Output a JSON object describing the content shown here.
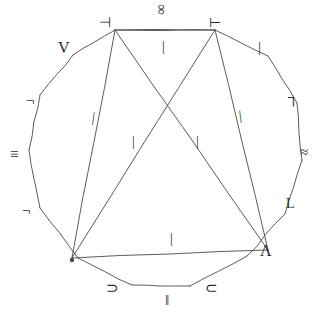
{
  "figure": {
    "stroke_color": "#4a4a4a",
    "symbol_color": "#2b2b2b",
    "background_color": "#ffffff",
    "width": 331,
    "height": 325
  },
  "chart_data": {
    "type": "diagram",
    "title": "",
    "xlabel": "",
    "ylabel": "",
    "polygon_vertices": [
      {
        "x": 115,
        "y": 30
      },
      {
        "x": 215,
        "y": 30
      },
      {
        "x": 268,
        "y": 56
      },
      {
        "x": 297,
        "y": 103
      },
      {
        "x": 302,
        "y": 160
      },
      {
        "x": 285,
        "y": 214
      },
      {
        "x": 247,
        "y": 256
      },
      {
        "x": 190,
        "y": 286
      },
      {
        "x": 132,
        "y": 285
      },
      {
        "x": 78,
        "y": 258
      },
      {
        "x": 40,
        "y": 208
      },
      {
        "x": 29,
        "y": 150
      },
      {
        "x": 40,
        "y": 95
      },
      {
        "x": 73,
        "y": 55
      }
    ],
    "triangle_vertices": [
      {
        "x": 115,
        "y": 30
      },
      {
        "x": 215,
        "y": 30
      },
      {
        "x": 72,
        "y": 258
      },
      {
        "x": 268,
        "y": 250
      }
    ],
    "chords": [
      {
        "from": {
          "x": 115,
          "y": 30
        },
        "to": {
          "x": 268,
          "y": 250
        }
      },
      {
        "from": {
          "x": 215,
          "y": 30
        },
        "to": {
          "x": 72,
          "y": 258
        }
      },
      {
        "from": {
          "x": 115,
          "y": 30
        },
        "to": {
          "x": 72,
          "y": 258
        }
      },
      {
        "from": {
          "x": 215,
          "y": 30
        },
        "to": {
          "x": 268,
          "y": 250
        }
      },
      {
        "from": {
          "x": 115,
          "y": 30
        },
        "to": {
          "x": 215,
          "y": 30
        }
      },
      {
        "from": {
          "x": 72,
          "y": 258
        },
        "to": {
          "x": 268,
          "y": 250
        }
      }
    ],
    "marked_point": {
      "x": 72,
      "y": 260,
      "label": "dot"
    }
  },
  "symbols": {
    "outer": [
      {
        "id": "infinity",
        "glyph": "∞",
        "name": "infinity-symbol",
        "x": 156,
        "y": 2,
        "size": 15,
        "rotate": 90
      },
      {
        "id": "turnstile_left",
        "glyph": "⊣",
        "name": "turnstile-left-symbol",
        "x": 99,
        "y": 16,
        "size": 14,
        "rotate": 0
      },
      {
        "id": "turnstile_right",
        "glyph": "⊢",
        "name": "turnstile-right-symbol",
        "x": 209,
        "y": 16,
        "size": 14,
        "rotate": 0
      },
      {
        "id": "vee_upper_left",
        "glyph": "V",
        "name": "vee-symbol",
        "x": 58,
        "y": 40,
        "size": 16,
        "rotate": 0
      },
      {
        "id": "tick_upper_right",
        "glyph": "|",
        "name": "tick-mark-upper-right",
        "x": 258,
        "y": 40,
        "size": 15,
        "rotate": 0
      },
      {
        "id": "corner_left_upper",
        "glyph": "¬",
        "name": "corner-upper-left-symbol",
        "x": 26,
        "y": 93,
        "size": 15,
        "rotate": 0
      },
      {
        "id": "corner_right_upper",
        "glyph": "┐",
        "name": "corner-upper-right-symbol",
        "x": 288,
        "y": 90,
        "size": 15,
        "rotate": 0
      },
      {
        "id": "identical_left",
        "glyph": "≡",
        "name": "identical-to-symbol",
        "x": 10,
        "y": 147,
        "size": 15,
        "rotate": 0
      },
      {
        "id": "approx_right",
        "glyph": "≈",
        "name": "approximately-equal-symbol",
        "x": 300,
        "y": 145,
        "size": 15,
        "rotate": 0
      },
      {
        "id": "corner_left_lower",
        "glyph": "¬",
        "name": "corner-lower-left-symbol",
        "x": 22,
        "y": 203,
        "size": 15,
        "rotate": 0
      },
      {
        "id": "ell_right_lower",
        "glyph": "L",
        "name": "ell-lower-right-symbol",
        "x": 286,
        "y": 197,
        "size": 14,
        "rotate": 0
      },
      {
        "id": "wedge_lower_right",
        "glyph": "Λ",
        "name": "wedge-symbol",
        "x": 260,
        "y": 243,
        "size": 16,
        "rotate": 0
      },
      {
        "id": "superset_bottom_left",
        "glyph": "⊃",
        "name": "superset-symbol",
        "x": 106,
        "y": 281,
        "size": 15,
        "rotate": 0
      },
      {
        "id": "parallel_bottom",
        "glyph": "‖",
        "name": "parallel-symbol",
        "x": 165,
        "y": 293,
        "size": 15,
        "rotate": 0
      },
      {
        "id": "subset_bottom_right",
        "glyph": "⊂",
        "name": "subset-symbol",
        "x": 205,
        "y": 281,
        "size": 15,
        "rotate": 0
      }
    ],
    "inner_ticks": [
      {
        "id": "tick_top_center",
        "glyph": "|",
        "name": "tick-mark-top-center",
        "x": 162,
        "y": 40,
        "size": 14,
        "rotate": 0
      },
      {
        "id": "tick_left_edge",
        "glyph": "|",
        "name": "tick-mark-left-edge",
        "x": 92,
        "y": 111,
        "size": 14,
        "rotate": 8
      },
      {
        "id": "tick_right_edge",
        "glyph": "|",
        "name": "tick-mark-right-edge",
        "x": 239,
        "y": 109,
        "size": 14,
        "rotate": -8
      },
      {
        "id": "tick_center_left",
        "glyph": "|",
        "name": "tick-mark-center-left",
        "x": 132,
        "y": 135,
        "size": 14,
        "rotate": 0
      },
      {
        "id": "tick_center_right",
        "glyph": "|",
        "name": "tick-mark-center-right",
        "x": 196,
        "y": 135,
        "size": 14,
        "rotate": 0
      },
      {
        "id": "tick_bottom_center",
        "glyph": "|",
        "name": "tick-mark-bottom-center",
        "x": 170,
        "y": 232,
        "size": 14,
        "rotate": 0
      }
    ]
  }
}
